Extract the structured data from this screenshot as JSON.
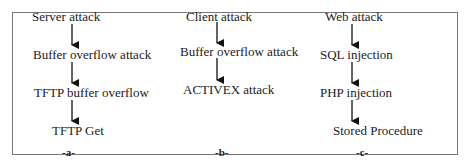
{
  "diagram": {
    "columns": [
      {
        "caption": "-a-",
        "nodes": [
          "Server attack",
          "Buffer overflow attack",
          "TFTP buffer overflow",
          "TFTP Get"
        ]
      },
      {
        "caption": "-b-",
        "nodes": [
          "Client attack",
          "Buffer overflow attack",
          "ACTIVEX attack"
        ]
      },
      {
        "caption": "-c-",
        "nodes": [
          "Web attack",
          "SQL injection",
          "PHP injection",
          "Stored Procedure"
        ]
      }
    ],
    "colors": {
      "text": "#222222",
      "arrow": "#111111",
      "border": "#777777"
    }
  }
}
